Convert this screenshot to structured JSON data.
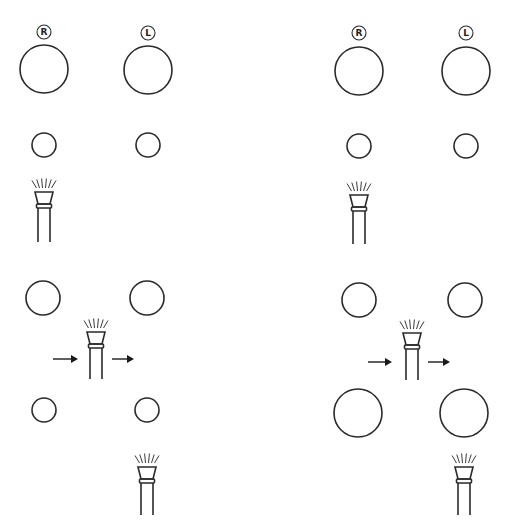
{
  "diagram": {
    "title": "",
    "stroke_color": "#2a2a2a",
    "background": "#ffffff",
    "panels": [
      {
        "name": "top-left-panel",
        "badges": [
          {
            "label": "R",
            "side": "right"
          },
          {
            "label": "L",
            "side": "left"
          }
        ],
        "description": "Two large circles (R, L), two small circles below, one nozzle under the R small circle"
      },
      {
        "name": "top-right-panel",
        "badges": [
          {
            "label": "R",
            "side": "right"
          },
          {
            "label": "L",
            "side": "left"
          }
        ],
        "description": "Two large circles (R, L), two small circles below, one nozzle under the R small circle"
      },
      {
        "name": "bottom-left-panel",
        "description": "Two medium circles, nozzle with arrows moving left-to-right between them, two small circles below, nozzle under right small circle",
        "arrows": [
          "right",
          "right"
        ]
      },
      {
        "name": "bottom-right-panel",
        "description": "Two medium circles, nozzle with arrows moving left-to-right between them, two large circles below, nozzle under right large circle",
        "arrows": [
          "right",
          "right"
        ]
      }
    ],
    "icons": {
      "nozzle": "spray-nozzle-icon",
      "arrow": "arrow-right-icon",
      "badge": "circle-letter-badge"
    }
  }
}
